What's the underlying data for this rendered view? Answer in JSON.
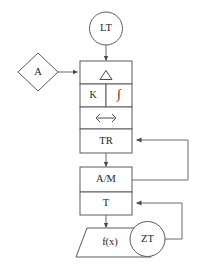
{
  "diagram": {
    "colors": {
      "stroke": "#5a5a5a",
      "connector": "#6b6b6b",
      "text": "#262626",
      "background": "#ffffff"
    },
    "nodes": {
      "source_circle": {
        "label": "LT",
        "shape": "circle"
      },
      "input_diamond": {
        "label": "A",
        "shape": "diamond"
      },
      "stack_row_1": {
        "label": "",
        "shape": "rectangle",
        "icon": "triangle-delta-icon"
      },
      "stack_row_2_left": {
        "label": "K",
        "shape": "rectangle"
      },
      "stack_row_2_right": {
        "label": "∫",
        "shape": "rectangle"
      },
      "stack_row_3": {
        "label": "",
        "shape": "rectangle",
        "icon": "left-right-arrow-icon"
      },
      "stack_row_4": {
        "label": "TR",
        "shape": "rectangle"
      },
      "mode_box": {
        "label": "A/M",
        "shape": "rectangle"
      },
      "t_box": {
        "label": "T",
        "shape": "rectangle"
      },
      "function_trapezoid": {
        "label": "f(x)",
        "shape": "trapezoid"
      },
      "feedback_circle": {
        "label": "ZT",
        "shape": "circle"
      }
    },
    "connectors": [
      {
        "name": "lt-to-stack",
        "from": "LT",
        "to": "Δ",
        "arrow": true
      },
      {
        "name": "a-to-stack",
        "from": "A",
        "to": "Δ",
        "arrow": true
      },
      {
        "name": "tr-to-am",
        "from": "TR",
        "to": "A/M",
        "arrow": true
      },
      {
        "name": "t-to-fx",
        "from": "T",
        "to": "f(x)",
        "arrow": true
      },
      {
        "name": "am-feedback-to-tr",
        "from": "A/M",
        "to": "TR",
        "arrow": true
      },
      {
        "name": "zt-feedback-to-t",
        "from": "ZT",
        "to": "T",
        "arrow": true
      }
    ]
  }
}
